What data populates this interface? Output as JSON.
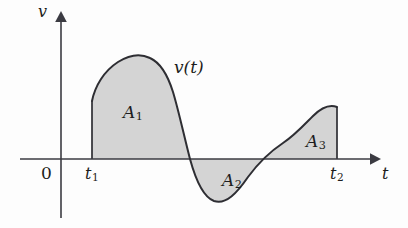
{
  "figure": {
    "kind": "velocity-time-curve-with-signed-areas",
    "background_color": "#fdfdfd",
    "axis_color": "#3b3b42",
    "curve_color": "#2e2e33",
    "region_fill_color": "#d4d4d4"
  },
  "axes": {
    "vertical_label": "v",
    "horizontal_label": "t",
    "origin_label": "0"
  },
  "curve": {
    "label_main": "v",
    "label_arg": "(t)",
    "label_full": "v(t)"
  },
  "ticks": {
    "t1": {
      "symbol": "t",
      "subscript": "1"
    },
    "t2": {
      "symbol": "t",
      "subscript": "2"
    }
  },
  "regions": [
    {
      "symbol": "A",
      "subscript": "1",
      "sign": "positive"
    },
    {
      "symbol": "A",
      "subscript": "2",
      "sign": "negative"
    },
    {
      "symbol": "A",
      "subscript": "3",
      "sign": "positive"
    }
  ]
}
